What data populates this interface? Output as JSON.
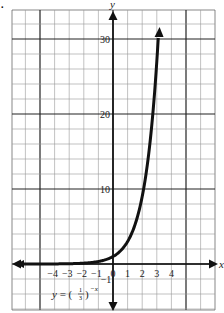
{
  "chart_data": {
    "type": "line",
    "title": "",
    "equation_label": "y = (1/3)^(-x)",
    "equation_parts": {
      "lhs": "y = (",
      "num": "1",
      "den": "3",
      "rhs": ")",
      "exp": "−x"
    },
    "xlabel": "x",
    "ylabel": "y",
    "xlim": [
      -6.5,
      7
    ],
    "ylim": [
      -3,
      34
    ],
    "x_ticks": [
      "−4",
      "−3",
      "−2",
      "−1",
      "0",
      "1",
      "2",
      "3",
      "4"
    ],
    "x_tick_values": [
      -4,
      -3,
      -2,
      -1,
      0,
      1,
      2,
      3,
      4
    ],
    "y_ticks": [
      "10",
      "20",
      "30"
    ],
    "y_tick_values": [
      10,
      20,
      30
    ],
    "y_extra_tick": "−1",
    "grid": true,
    "series": [
      {
        "name": "y = (1/3)^(-x)",
        "x": [
          -6,
          -4,
          -3,
          -2,
          -1,
          0,
          1,
          2,
          2.5,
          3,
          3.1
        ],
        "values": [
          0.0014,
          0.012,
          0.037,
          0.111,
          0.333,
          1,
          3,
          9,
          15.6,
          27,
          30.1
        ]
      }
    ],
    "legend": "none"
  },
  "corner_mark": "."
}
